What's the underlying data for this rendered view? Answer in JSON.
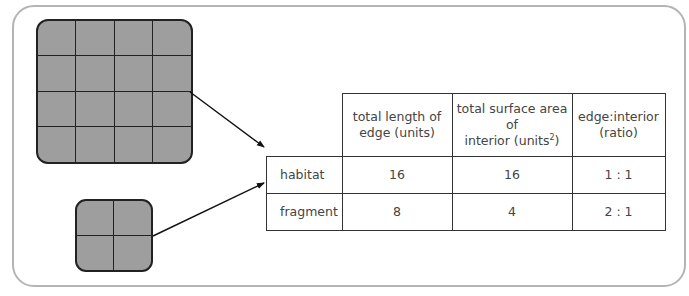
{
  "diagram": {
    "habitat_block": {
      "label": "habitat",
      "grid": [
        4,
        4
      ],
      "fill": "#9e9e9e"
    },
    "fragment_block": {
      "label": "fragment",
      "grid": [
        2,
        2
      ],
      "fill": "#9e9e9e"
    }
  },
  "table": {
    "headers": [
      "",
      "total length of edge (units)",
      "total surface area of interior (units²)",
      "edge:interior (ratio)"
    ],
    "header_parts": {
      "edge_line1": "total length of",
      "edge_line2": "edge (units)",
      "area_line1": "total surface area of",
      "area_line2": "interior (units",
      "area_sup": "2",
      "area_close": ")",
      "ratio_line1": "edge:interior",
      "ratio_line2": "(ratio)"
    },
    "rows": [
      {
        "label": "habitat",
        "edge": "16",
        "area": "16",
        "ratio": "1 : 1"
      },
      {
        "label": "fragment",
        "edge": "8",
        "area": "4",
        "ratio": "2 : 1"
      }
    ]
  }
}
